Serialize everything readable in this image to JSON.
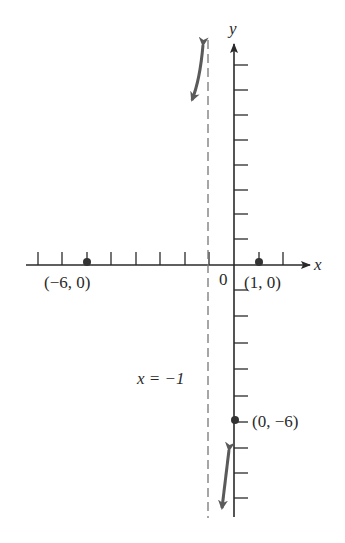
{
  "diagram": {
    "axes": {
      "x_label": "x",
      "y_label": "y",
      "origin_label": "0",
      "x_ticks": [
        -8,
        -7,
        -6,
        -5,
        -4,
        -3,
        -2,
        -1,
        1,
        2
      ],
      "y_ticks_positive": [
        1,
        2,
        3,
        4,
        5,
        6,
        7,
        8
      ],
      "y_ticks_negative": [
        -1,
        -2,
        -3,
        -4,
        -5,
        -6,
        -7,
        -8,
        -9
      ]
    },
    "asymptote": {
      "label": "x = −1",
      "x": -1,
      "style": "dashed"
    },
    "points": [
      {
        "label": "(−6, 0)",
        "x": -6,
        "y": 0
      },
      {
        "label": "(1, 0)",
        "x": 1,
        "y": 0
      },
      {
        "label": "(0, −6)",
        "x": 0,
        "y": -6
      }
    ],
    "arrows": [
      {
        "name": "upper-branch-arrow",
        "description": "double-headed curved arrow left of asymptote near top"
      },
      {
        "name": "lower-branch-arrow",
        "description": "double-headed arrow between asymptote and y-axis near bottom"
      }
    ],
    "colors": {
      "axis": "#2a2a2a",
      "asymptote": "#777777",
      "arrow": "#5a5a5a",
      "point": "#333333"
    }
  }
}
